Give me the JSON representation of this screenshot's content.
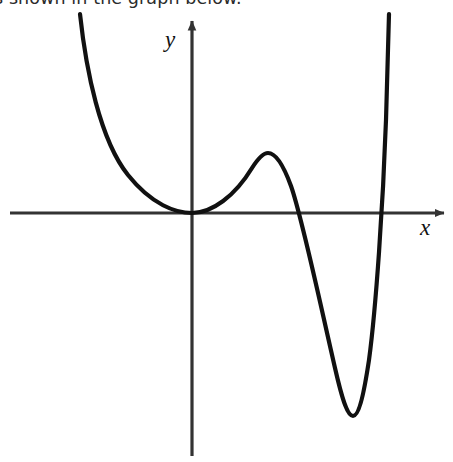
{
  "page": {
    "background_color": "#ffffff",
    "width": 453,
    "height": 462
  },
  "prompt": {
    "text": "s shown in the graph below.",
    "note": "clipped at top edge of screenshot",
    "color": "#2b2b2b"
  },
  "figure": {
    "name": "polynomial-graph",
    "stroke_color": "#111111",
    "axis_color": "#333333",
    "curve_width": 4.2,
    "axis_width": 3.2,
    "axes": {
      "x_label": "x",
      "y_label": "y",
      "origin": {
        "x": 192,
        "y": 213
      },
      "x_axis": {
        "x1": 10,
        "y1": 213,
        "x2": 448,
        "y2": 213,
        "arrow": "right"
      },
      "y_axis": {
        "x1": 192,
        "y1": 16,
        "x2": 192,
        "y2": 456,
        "arrow": "up"
      },
      "x_label_pos": {
        "x": 421,
        "y": 234
      },
      "y_label_pos": {
        "x": 170,
        "y": 47
      }
    }
  },
  "chart_data": {
    "type": "line",
    "title": "",
    "xlabel": "x",
    "ylabel": "y",
    "grid": false,
    "legend": null,
    "axis_ranges": {
      "x_pixels": [
        10,
        448
      ],
      "y_pixels": [
        16,
        456
      ]
    },
    "features": [
      {
        "name": "left-branch-top",
        "pixel_x": 80,
        "pixel_y": 14,
        "kind": "endpoint"
      },
      {
        "name": "double-root-tangent-origin",
        "pixel_x": 192,
        "pixel_y": 213,
        "kind": "root-tangent"
      },
      {
        "name": "local-maximum",
        "pixel_x": 268,
        "pixel_y": 153,
        "kind": "local-max"
      },
      {
        "name": "x-intercept-middle",
        "pixel_x": 302,
        "pixel_y": 213,
        "kind": "root"
      },
      {
        "name": "local-minimum",
        "pixel_x": 352,
        "pixel_y": 416,
        "kind": "local-min"
      },
      {
        "name": "x-intercept-right",
        "pixel_x": 385,
        "pixel_y": 213,
        "kind": "root"
      },
      {
        "name": "right-branch-top",
        "pixel_x": 389,
        "pixel_y": 14,
        "kind": "endpoint"
      }
    ],
    "curve_path": "M 80,14 C 86,70 100,140 128,175 C 152,205 176,213 192,213 C 212,213 235,196 252,168 C 259,157 264,153 268,153 C 275,153 283,164 291,186 C 302,217 320,303 335,368 C 343,403 348,416 353,416 C 358,416 363,400 369,360 C 376,308 383,205 386,120 C 387,80 388,40 389,14"
  }
}
